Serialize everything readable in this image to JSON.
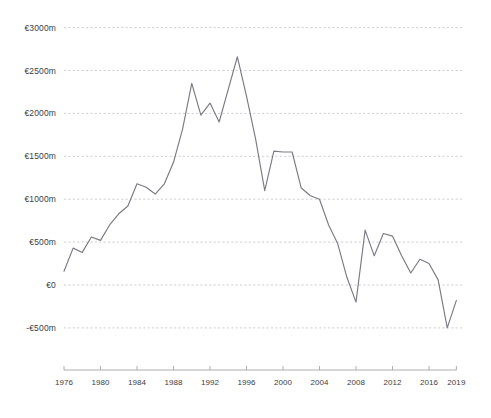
{
  "chart_data": {
    "type": "line",
    "title": "",
    "subtitle": "",
    "xlabel": "",
    "ylabel": "",
    "currency_symbol": "€",
    "unit_suffix": "m",
    "xlim": [
      1976,
      2019
    ],
    "ylim": [
      -750,
      3100
    ],
    "grid": true,
    "legend": null,
    "y_ticks": [
      3000,
      2500,
      2000,
      1500,
      1000,
      500,
      0,
      -500
    ],
    "y_tick_labels": [
      "€3000m",
      "€2500m",
      "€2000m",
      "€1500m",
      "€1000m",
      "€500m",
      "€0",
      "-€500m"
    ],
    "x_ticks": [
      1976,
      1980,
      1984,
      1988,
      1992,
      1996,
      2000,
      2004,
      2008,
      2012,
      2016,
      2019
    ],
    "x_tick_labels": [
      "1976",
      "1980",
      "1984",
      "1988",
      "1992",
      "1996",
      "2000",
      "2004",
      "2008",
      "2012",
      "2016",
      "2019"
    ],
    "series": [
      {
        "name": "Balance",
        "color": "#7a7a84",
        "x": [
          1976,
          1977,
          1978,
          1979,
          1980,
          1981,
          1982,
          1983,
          1984,
          1985,
          1986,
          1987,
          1988,
          1989,
          1990,
          1991,
          1992,
          1993,
          1994,
          1995,
          1996,
          1997,
          1998,
          1999,
          2000,
          2001,
          2002,
          2003,
          2004,
          2005,
          2006,
          2007,
          2008,
          2009,
          2010,
          2011,
          2012,
          2013,
          2014,
          2015,
          2016,
          2017,
          2018,
          2019
        ],
        "values": [
          160,
          430,
          380,
          560,
          520,
          700,
          830,
          920,
          1180,
          1140,
          1060,
          1180,
          1430,
          1820,
          2350,
          1980,
          2120,
          1900,
          2280,
          2660,
          2200,
          1700,
          1100,
          1560,
          1550,
          1550,
          1130,
          1040,
          1000,
          700,
          480,
          90,
          -200,
          640,
          340,
          600,
          570,
          340,
          140,
          300,
          250,
          60,
          -500,
          -180
        ]
      }
    ]
  },
  "axes": {
    "x_axis_name": "year-axis",
    "y_axis_name": "value-axis"
  }
}
